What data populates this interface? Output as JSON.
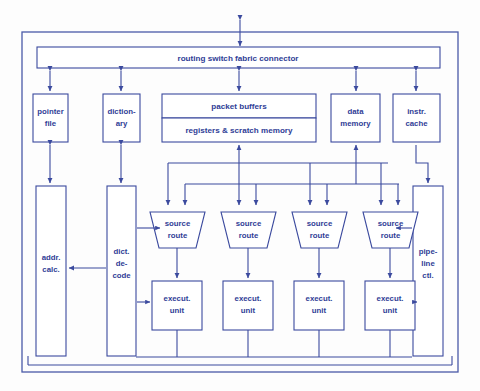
{
  "diagram": {
    "colors": {
      "stroke": "#3b4a9e",
      "text": "#2f3d96",
      "frame": "#4a5aa8",
      "background": "#ffffff"
    },
    "blocks": {
      "routing_connector": {
        "label": "routing switch fabric connector"
      },
      "pointer_file": {
        "line1": "pointer",
        "line2": "file"
      },
      "dictionary": {
        "line1": "diction-",
        "line2": "ary"
      },
      "packet_buffers": {
        "label": "packet buffers"
      },
      "registers_scratch": {
        "label": "registers & scratch memory"
      },
      "data_memory": {
        "line1": "data",
        "line2": "memory"
      },
      "instr_cache": {
        "line1": "instr.",
        "line2": "cache"
      },
      "addr_calc": {
        "line1": "addr.",
        "line2": "calc."
      },
      "dict_decode": {
        "line1": "dict.",
        "line2": "de-",
        "line3": "code"
      },
      "pipeline_ctl": {
        "line1": "pipe-",
        "line2": "line",
        "line3": "ctl."
      },
      "source_routes": [
        {
          "line1": "source",
          "line2": "route"
        },
        {
          "line1": "source",
          "line2": "route"
        },
        {
          "line1": "source",
          "line2": "route"
        },
        {
          "line1": "source",
          "line2": "route"
        }
      ],
      "execution_units": [
        {
          "line1": "execut.",
          "line2": "unit"
        },
        {
          "line1": "execut.",
          "line2": "unit"
        },
        {
          "line1": "execut.",
          "line2": "unit"
        },
        {
          "line1": "execut.",
          "line2": "unit"
        }
      ]
    }
  }
}
